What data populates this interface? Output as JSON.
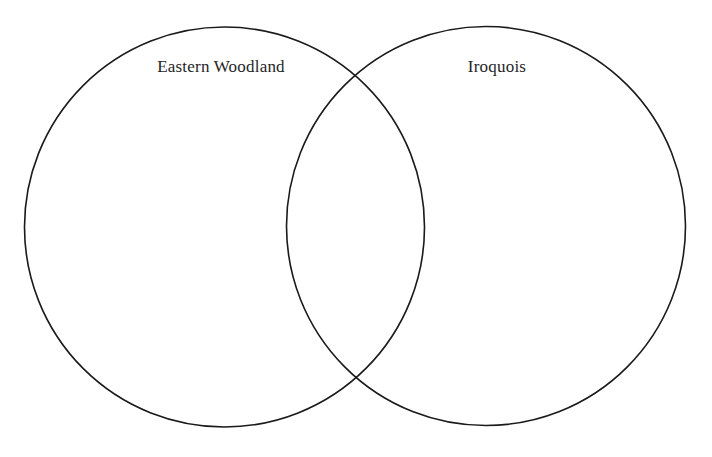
{
  "diagram": {
    "type": "venn",
    "sets": [
      {
        "id": "left",
        "label": "Eastern Woodland"
      },
      {
        "id": "right",
        "label": "Iroquois"
      }
    ],
    "regions": {
      "left_only": [],
      "overlap": [],
      "right_only": []
    },
    "colors": {
      "stroke": "#1a1a1a",
      "background": "#ffffff",
      "text": "#1f1f1f"
    }
  }
}
